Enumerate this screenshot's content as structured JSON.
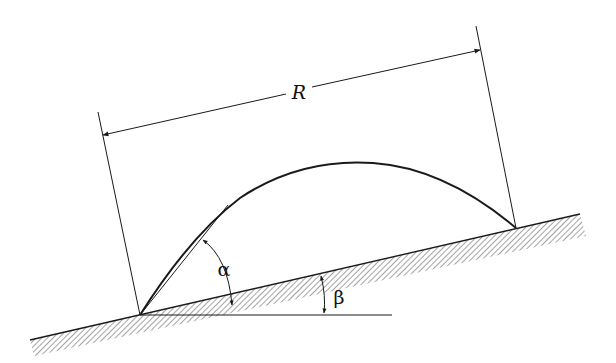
{
  "diagram": {
    "labels": {
      "range": "R",
      "launch_angle": "α",
      "incline_angle": "β"
    },
    "colors": {
      "ink": "#1a1a1a",
      "background": "#ffffff",
      "hatch": "#555555"
    },
    "elements": [
      "inclined ground surface (hatched)",
      "horizontal reference line",
      "parabolic trajectory",
      "launch tangent line",
      "range dimension line with arrows",
      "extension lines"
    ]
  }
}
